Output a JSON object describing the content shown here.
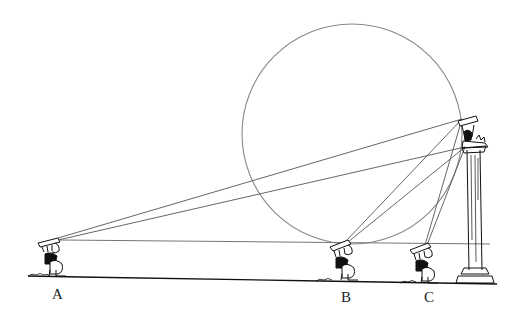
{
  "figure": {
    "type": "geometric illustration",
    "colors": {
      "ink": "#111111",
      "line": "#777777",
      "background": "#ffffff"
    }
  },
  "labels": {
    "a": "A",
    "b": "B",
    "c": "C"
  },
  "observers": [
    {
      "id": "A",
      "eye": [
        55,
        240
      ],
      "feet_x": 58
    },
    {
      "id": "B",
      "eye": [
        345,
        242
      ],
      "feet_x": 345
    },
    {
      "id": "C",
      "eye": [
        425,
        245
      ],
      "feet_x": 430
    }
  ],
  "statue": {
    "top": [
      462,
      119
    ],
    "bottom": [
      465,
      147
    ]
  },
  "circle": {
    "center": [
      352,
      134
    ],
    "radius": 110
  }
}
